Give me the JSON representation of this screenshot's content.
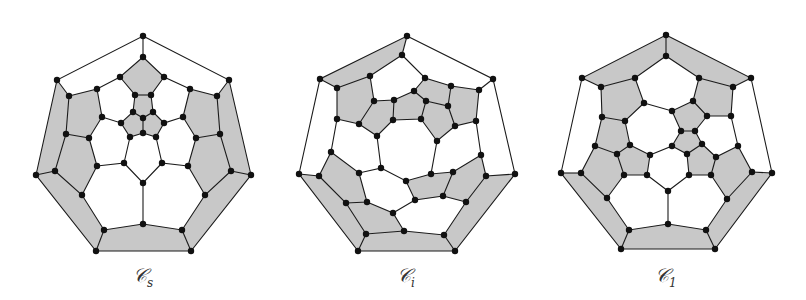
{
  "figure": {
    "colors": {
      "shade": "#c8c8c8",
      "edge": "#1a1a1a",
      "vertex": "#111111",
      "background": "#ffffff"
    },
    "graphs": [
      {
        "id": "cs",
        "label_main": "𝒞",
        "label_sub": "s",
        "symmetry": "Cs"
      },
      {
        "id": "ci",
        "label_main": "𝒞",
        "label_sub": "i",
        "symmetry": "Ci"
      },
      {
        "id": "c1",
        "label_main": "𝒞",
        "label_sub": "1",
        "symmetry": "C1"
      }
    ]
  }
}
